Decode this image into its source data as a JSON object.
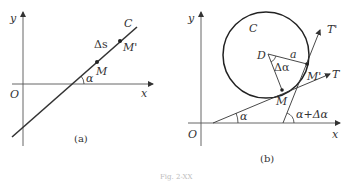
{
  "figure": {
    "caption": "Fig. 2-XX",
    "panel_a": {
      "caption": "(a)",
      "labels": {
        "y_axis": "y",
        "x_axis": "x",
        "origin": "O",
        "curve": "C",
        "arc_length": "Δs",
        "point_m": "M",
        "point_m_prime": "M'",
        "angle": "α"
      }
    },
    "panel_b": {
      "caption": "(b)",
      "labels": {
        "y_axis": "y",
        "x_axis": "x",
        "origin": "O",
        "curve": "C",
        "center": "D",
        "radius": "a",
        "delta_angle": "Δα",
        "point_m": "M",
        "point_m_prime": "M'",
        "tangent_t": "T",
        "tangent_t_prime": "T'",
        "angle": "α",
        "angle_sum": "α+Δα"
      }
    }
  },
  "colors": {
    "stroke": "#333333",
    "axis": "#555555",
    "background": "#ffffff"
  }
}
